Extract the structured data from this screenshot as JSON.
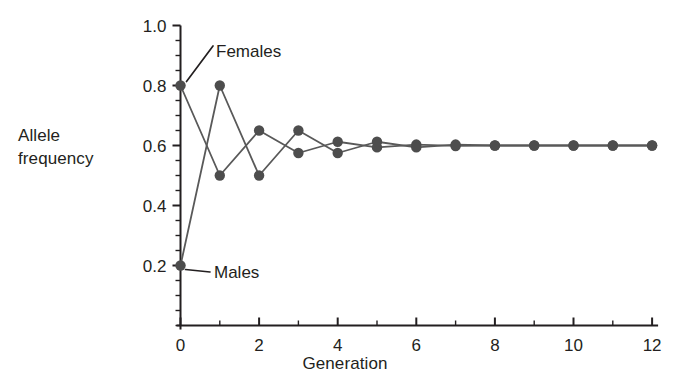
{
  "chart_data": {
    "type": "line",
    "title": "",
    "subtitle": "",
    "xlabel": "Generation",
    "ylabel": "Allele frequency",
    "ylabel_lines": [
      "Allele",
      "frequency"
    ],
    "x": [
      0,
      1,
      2,
      3,
      4,
      5,
      6,
      7,
      8,
      9,
      10,
      11,
      12
    ],
    "xlim": [
      0,
      12
    ],
    "ylim": [
      0.0,
      1.0
    ],
    "xticks": [
      0,
      2,
      4,
      6,
      8,
      10,
      12
    ],
    "xtick_labels": [
      "0",
      "2",
      "4",
      "6",
      "8",
      "10",
      "12"
    ],
    "x_minor_tick_step": 1,
    "yticks": [
      0.2,
      0.4,
      0.6,
      0.8,
      1.0
    ],
    "ytick_labels": [
      "0.2",
      "0.4",
      "0.6",
      "0.8",
      "1.0"
    ],
    "y_minor_tick_step": 0.05,
    "grid": false,
    "legend_position": "inline-annotation",
    "series": [
      {
        "name": "Females",
        "label": "Females",
        "color": "#595959",
        "values": [
          0.8,
          0.5,
          0.65,
          0.575,
          0.6125,
          0.59375,
          0.603125,
          0.5984375,
          0.6,
          0.6,
          0.6,
          0.6,
          0.6
        ]
      },
      {
        "name": "Males",
        "label": "Males",
        "color": "#595959",
        "values": [
          0.2,
          0.8,
          0.5,
          0.65,
          0.575,
          0.6125,
          0.59375,
          0.603125,
          0.6,
          0.6,
          0.6,
          0.6,
          0.6
        ]
      }
    ],
    "annotations": [
      {
        "text": "Females",
        "points_to_series": "Females",
        "points_to_x": 0,
        "points_to_y": 0.8
      },
      {
        "text": "Males",
        "points_to_series": "Males",
        "points_to_x": 0,
        "points_to_y": 0.2
      }
    ]
  },
  "style": {
    "axis_color": "#231f20",
    "line_color": "#595959",
    "marker_color": "#4d4d4d",
    "background": "#ffffff"
  }
}
